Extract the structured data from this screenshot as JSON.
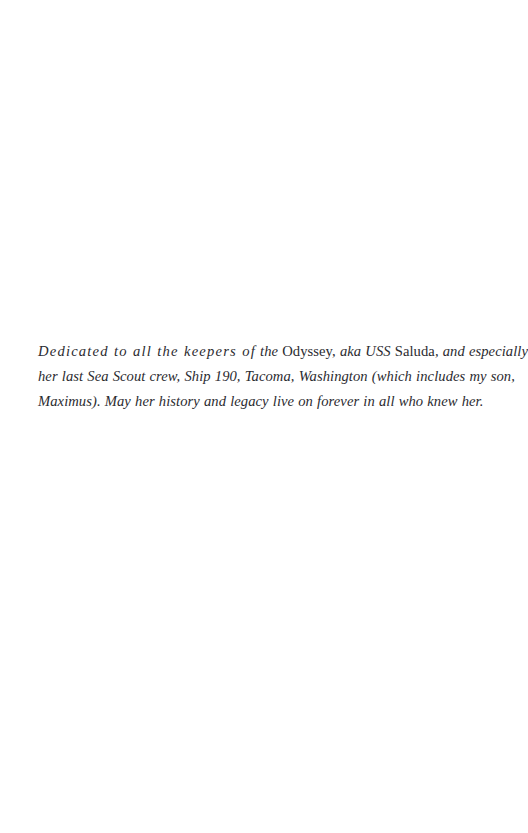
{
  "page": {
    "kind": "book-dedication-page",
    "background_color": "#ffffff",
    "text_color": "#2b2b30",
    "width": 496,
    "height": 833
  },
  "dedication": {
    "full_text": "Dedicated to all the keepers of the Odyssey, aka USS Saluda, and especially her last Sea Scout crew, Ship 190, Tacoma, Washington (which includes my son, Maximus). May her history and legacy live on forever in all who knew her.",
    "lines": [
      {
        "index": 1,
        "runs": [
          {
            "text": "Dedicated to all the keepers of",
            "style": "italic"
          },
          {
            "text": " the ",
            "style": "italic"
          },
          {
            "text": "Odyssey,",
            "style": "roman"
          },
          {
            "text": " aka USS ",
            "style": "italic"
          },
          {
            "text": "Saluda",
            "style": "roman"
          },
          {
            "text": ", and especially",
            "style": "italic"
          }
        ]
      },
      {
        "index": 2,
        "runs": [
          {
            "text": "her last Sea Scout crew, Ship 190, Tacoma, Washington (which includes my son,",
            "style": "italic"
          }
        ]
      },
      {
        "index": 3,
        "runs": [
          {
            "text": "Maximus). May her history and legacy live on forever in all who knew her.",
            "style": "italic"
          }
        ]
      }
    ],
    "line1_part1": "Dedicated to all the keepers of",
    "line1_part2": "the",
    "line1_ship_name": "Odyssey,",
    "line1_part3": "aka USS",
    "line1_ship_designation": "Saluda",
    "line1_part4": ", and especially",
    "line2": "her last Sea Scout crew, Ship 190, Tacoma, Washington (which includes my son,",
    "line3": "Maximus). May her history and legacy live on forever in all who knew her."
  },
  "folio": {
    "number": ""
  }
}
